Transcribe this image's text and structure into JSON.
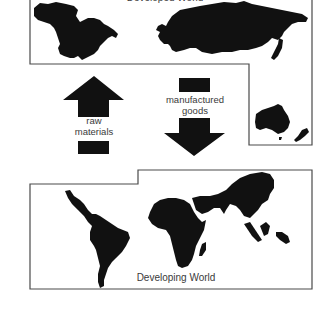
{
  "diagram": {
    "type": "trade-flow",
    "colors": {
      "background": "#ffffff",
      "border": "#4a4a4a",
      "landmass": "#111111",
      "arrow": "#111111",
      "text": "#3a3a3a"
    },
    "regions": {
      "developed": {
        "label": "Developed World",
        "landmasses": [
          "North America",
          "Europe & Asia (Russia)",
          "Japan",
          "Australia",
          "New Zealand"
        ]
      },
      "developing": {
        "label": "Developing World",
        "landmasses": [
          "Latin America",
          "Africa",
          "Madagascar",
          "Middle East & South Asia",
          "Southeast Asia"
        ]
      }
    },
    "flows": [
      {
        "id": "raw-materials",
        "label_line1": "raw",
        "label_line2": "materials",
        "direction": "up",
        "from": "Developing World",
        "to": "Developed World"
      },
      {
        "id": "manufactured-goods",
        "label_line1": "manufactured",
        "label_line2": "goods",
        "direction": "down",
        "from": "Developed World",
        "to": "Developing World"
      }
    ]
  }
}
